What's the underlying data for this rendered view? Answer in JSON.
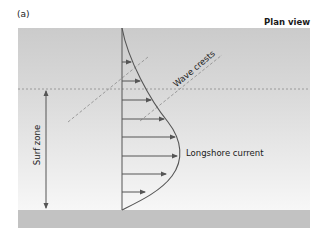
{
  "figure": {
    "panel_label": "(a)",
    "view_label": "Plan view",
    "labels": {
      "wave_crests": "Wave crests",
      "surf_zone": "Surf zone",
      "longshore_current": "Longshore current"
    },
    "colors": {
      "sea_top": "#cfcfcf",
      "sea_bottom": "#f6f6f6",
      "beach": "#c2c2c2",
      "line": "#555555",
      "dashed": "#8a8a8a",
      "arrow": "#555555"
    },
    "current_profile": {
      "axis_x": 122,
      "arrows": [
        {
          "y": 62,
          "to_x": 131
        },
        {
          "y": 81,
          "to_x": 140
        },
        {
          "y": 100,
          "to_x": 151
        },
        {
          "y": 119,
          "to_x": 164
        },
        {
          "y": 137,
          "to_x": 175
        },
        {
          "y": 156,
          "to_x": 177
        },
        {
          "y": 174,
          "to_x": 166
        },
        {
          "y": 192,
          "to_x": 145
        }
      ]
    }
  }
}
